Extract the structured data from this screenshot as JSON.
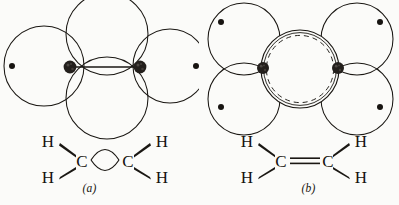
{
  "figure": {
    "background_color": "#fbfbf9",
    "ink_color": "#1a1713",
    "nucleus_color": "#231f1c",
    "caption_cut_off": ""
  },
  "panels": [
    {
      "key": "a",
      "label": "(a)",
      "model_name": "bent-bond-model",
      "orbital_diagram": {
        "hydrogen_orbitals": [
          {
            "name": "hydrogen-orbital-left",
            "cx": 44,
            "cy": 66,
            "r": 40,
            "proton_dot": {
              "cx": 12,
              "cy": 66,
              "r": 3.0
            }
          },
          {
            "name": "hydrogen-orbital-right",
            "cx": 170,
            "cy": 66,
            "r": 37,
            "proton_dot": {
              "cx": 196,
              "cy": 66,
              "r": 3.0
            }
          }
        ],
        "bond_orbitals": [
          {
            "name": "bent-bond-orbital-top",
            "cx": 107,
            "cy": 34,
            "r": 41
          },
          {
            "name": "bent-bond-orbital-bottom",
            "cx": 107,
            "cy": 98,
            "r": 41
          }
        ],
        "carbon_nuclei": [
          {
            "name": "carbon-nucleus-left",
            "cx": 70,
            "cy": 67,
            "r": 6.4
          },
          {
            "name": "carbon-nucleus-right",
            "cx": 140,
            "cy": 67,
            "r": 6.4
          }
        ],
        "internuclear_axis": {
          "name": "carbon-carbon-axis",
          "x1": 70,
          "y1": 67,
          "x2": 140,
          "y2": 67
        }
      },
      "structural_formula": {
        "atoms": [
          {
            "name": "hydrogen-label-upper-left",
            "text": "H",
            "x": 48,
            "y": 147
          },
          {
            "name": "hydrogen-label-lower-left",
            "text": "H",
            "x": 48,
            "y": 176
          },
          {
            "name": "carbon-label-left",
            "text": "C",
            "x": 81,
            "y": 163
          },
          {
            "name": "carbon-label-right",
            "text": "C",
            "x": 128,
            "y": 163
          },
          {
            "name": "hydrogen-label-upper-right",
            "text": "H",
            "x": 161,
            "y": 147
          },
          {
            "name": "hydrogen-label-lower-right",
            "text": "H",
            "x": 161,
            "y": 176
          }
        ],
        "bond_style": "bent-bond-lens",
        "bond_description": "lens (eye) shaped bent bond between the two carbons"
      }
    },
    {
      "key": "b",
      "label": "(b)",
      "model_name": "sigma-pi-model",
      "orbital_diagram": {
        "hydrogen_orbitals": [
          {
            "name": "hydrogen-orbital-top-left",
            "cx": 44,
            "cy": 39,
            "r": 36,
            "proton_dot": {
              "cx": 21,
              "cy": 22,
              "r": 3.0
            }
          },
          {
            "name": "hydrogen-orbital-bottom-left",
            "cx": 44,
            "cy": 99,
            "r": 36,
            "proton_dot": {
              "cx": 21,
              "cy": 107,
              "r": 3.0
            }
          },
          {
            "name": "hydrogen-orbital-top-right",
            "cx": 157,
            "cy": 39,
            "r": 36,
            "proton_dot": {
              "cx": 180,
              "cy": 22,
              "r": 3.0
            }
          },
          {
            "name": "hydrogen-orbital-bottom-right",
            "cx": 157,
            "cy": 99,
            "r": 36,
            "proton_dot": {
              "cx": 180,
              "cy": 107,
              "r": 3.0
            }
          }
        ],
        "pi_orbital": {
          "name": "pi-orbital",
          "cx": 100,
          "cy": 69,
          "r_outer": 39,
          "r_inner": 34,
          "outer_style": "solid",
          "inner_style": "dashed"
        },
        "carbon_nuclei": [
          {
            "name": "carbon-nucleus-left",
            "cx": 63,
            "cy": 68,
            "r": 6.0
          },
          {
            "name": "carbon-nucleus-right",
            "cx": 138,
            "cy": 68,
            "r": 6.0
          }
        ]
      },
      "structural_formula": {
        "atoms": [
          {
            "name": "hydrogen-label-upper-left",
            "text": "H",
            "x": 47,
            "y": 147
          },
          {
            "name": "hydrogen-label-lower-left",
            "text": "H",
            "x": 47,
            "y": 176
          },
          {
            "name": "carbon-label-left",
            "text": "C",
            "x": 80,
            "y": 163
          },
          {
            "name": "carbon-label-right",
            "text": "C",
            "x": 127,
            "y": 163
          },
          {
            "name": "hydrogen-label-upper-right",
            "text": "H",
            "x": 160,
            "y": 147
          },
          {
            "name": "hydrogen-label-lower-right",
            "text": "H",
            "x": 160,
            "y": 176
          }
        ],
        "bond_style": "double-line",
        "bond_description": "conventional C=C double bond drawn as two parallel lines"
      }
    }
  ]
}
